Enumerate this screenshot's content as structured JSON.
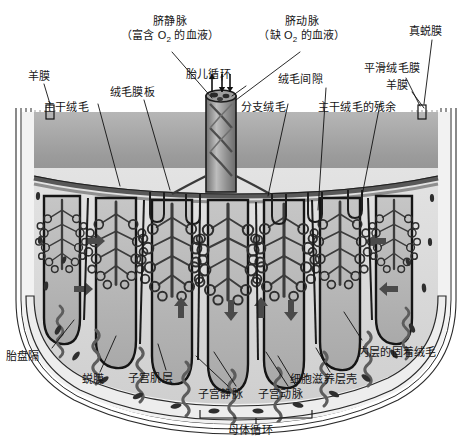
{
  "figure": {
    "kind": "anatomical-cross-section",
    "palette": {
      "ink": "#111111",
      "outline": "#1a1a1a",
      "chorionic_plate": "#9a9a9a",
      "intervillous_space": "#d9d9d9",
      "cotyledon": "#b9b9b9",
      "myometrium": "#ececec",
      "vessel": "#6e6e6e",
      "background": "#ffffff"
    }
  },
  "labels": {
    "amnion_left": "羊膜",
    "stem_villus_left": "主干绒毛",
    "chorionic_plate": "绒毛膜板",
    "umbilical_vein_title": "脐静脉",
    "umbilical_vein_note_pre": "（富含 O",
    "umbilical_vein_note_post": " 的血液）",
    "umbilical_artery_title": "脐动脉",
    "umbilical_artery_note_pre": "（缺 O",
    "umbilical_artery_note_post": " 的血液）",
    "fetal_circulation": "胎儿循环",
    "intervillous_space": "绒毛间隙",
    "branch_villus": "分支绒毛",
    "stem_villus_remnant": "主干绒毛的残余",
    "decidua_vera": "真蜕膜",
    "chorion_laeve": "平滑绒毛膜",
    "amnion_right": "羊膜",
    "placental_septum": "胎盘隔",
    "decidua": "蜕膜",
    "myometrium": "子宫肌层",
    "uterine_vein": "子宫静脉",
    "uterine_artery": "子宫动脉",
    "maternal_circulation": "母体循环",
    "cytotrophoblast_shell": "细胞滋养层壳",
    "anchoring_villus": "内层的固着绒毛",
    "o2_subscript": "2"
  }
}
